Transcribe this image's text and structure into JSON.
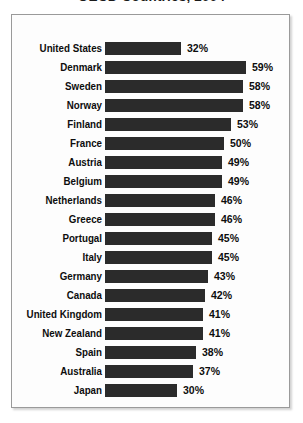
{
  "chart_data": {
    "type": "bar",
    "title": "OECD Countries, 2004",
    "orientation": "horizontal",
    "xlabel": "",
    "ylabel": "",
    "xlim": [
      0,
      65
    ],
    "grid": false,
    "legend": null,
    "value_suffix": "%",
    "categories": [
      "United States",
      "Denmark",
      "Sweden",
      "Norway",
      "Finland",
      "France",
      "Austria",
      "Belgium",
      "Netherlands",
      "Greece",
      "Portugal",
      "Italy",
      "Germany",
      "Canada",
      "United Kingdom",
      "New Zealand",
      "Spain",
      "Australia",
      "Japan"
    ],
    "values": [
      32,
      59,
      58,
      58,
      53,
      50,
      49,
      49,
      46,
      46,
      45,
      45,
      43,
      42,
      41,
      41,
      38,
      37,
      30
    ],
    "value_labels": [
      "32%",
      "59%",
      "58%",
      "58%",
      "53%",
      "50%",
      "49%",
      "49%",
      "46%",
      "46%",
      "45%",
      "45%",
      "43%",
      "42%",
      "41%",
      "41%",
      "38%",
      "37%",
      "30%"
    ],
    "bar_color": "#2b2b2b"
  }
}
